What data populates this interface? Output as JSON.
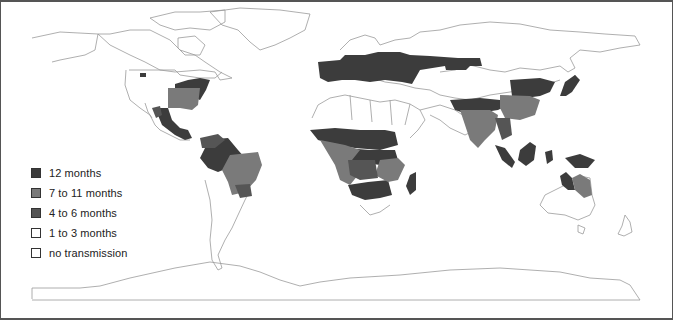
{
  "map": {
    "type": "world choropleth",
    "subject": "months of transmission",
    "colors": {
      "c12": "#3c3c3c",
      "c7_11": "#7a7a7a",
      "c4_6": "#555555",
      "c1_3": "#ffffff",
      "none": "#ffffff",
      "outline": "#9a9a9a",
      "frame": "#555555"
    }
  },
  "legend": {
    "items": [
      {
        "label": "12 months",
        "color": "#3c3c3c"
      },
      {
        "label": "7 to 11 months",
        "color": "#7a7a7a"
      },
      {
        "label": "4 to 6 months",
        "color": "#555555"
      },
      {
        "label": "1 to 3 months",
        "color": "#ffffff"
      },
      {
        "label": "no transmission",
        "color": "#ffffff"
      }
    ]
  }
}
